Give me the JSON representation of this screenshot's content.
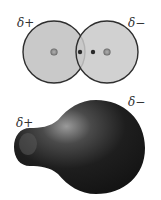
{
  "top_diagram": {
    "label_left": "δ+",
    "label_right": "δ−",
    "atom_fill": "#c8c8c8",
    "atom_stroke": "#333333",
    "nucleus_color": "#8c8c8c",
    "electron_color": "#2a2a2a"
  },
  "bottom_diagram": {
    "label_left": "δ+",
    "label_right": "δ−",
    "body_color": "#1c1c1c",
    "highlight_color": "#8a8a8a"
  }
}
